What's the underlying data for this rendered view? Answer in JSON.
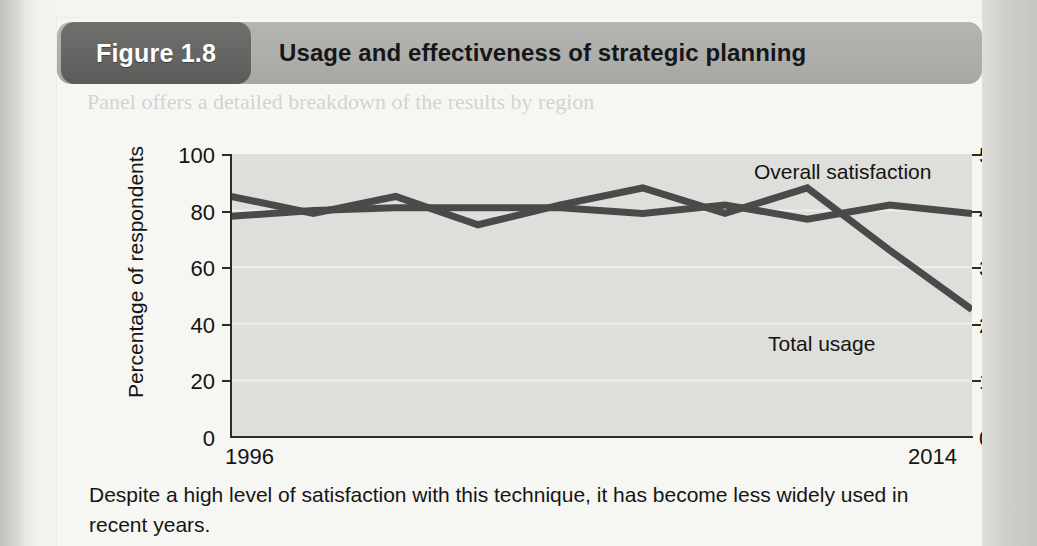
{
  "figure": {
    "badge_label": "Figure 1.8",
    "title": "Usage and effectiveness of strategic planning",
    "caption": "Despite a high level of satisfaction with this technique, it has become less widely used in recent years.",
    "ghost_text": "Panel offers a detailed breakdown of the results by region"
  },
  "colors": {
    "badge_background": "#646462",
    "header_background": "#aeaeaa",
    "plot_background": "#dededa",
    "line": "#4a4a4a",
    "axis": "#2b2b2b",
    "gridline": "#f0f0ec",
    "page_background": "#f6f6f3"
  },
  "chart_data": {
    "type": "line",
    "title": "Usage and effectiveness of strategic planning",
    "xlabel": "",
    "ylabel": "Percentage of respondents",
    "y2label": "5 = Highest satisfaction",
    "xlim": [
      1996,
      2014
    ],
    "ylim": [
      0,
      100
    ],
    "y2lim": [
      0,
      5
    ],
    "xticks": [
      1996,
      2014
    ],
    "xticklabels": [
      "1996",
      "2014"
    ],
    "yticks": [
      0,
      20,
      40,
      60,
      80,
      100
    ],
    "yticklabels": [
      "0",
      "20",
      "40",
      "60",
      "80",
      "100"
    ],
    "y2ticks": [
      0,
      1,
      2,
      3,
      4,
      5
    ],
    "y2ticklabels": [
      "0",
      "1",
      "2",
      "3",
      "4",
      "5"
    ],
    "grid": true,
    "legend_position": "inline-annotation",
    "x": [
      1996,
      1998,
      2000,
      2002,
      2004,
      2006,
      2008,
      2010,
      2012,
      2014
    ],
    "series": [
      {
        "name": "Total usage",
        "axis": "left",
        "units": "percentage of respondents",
        "values": [
          85,
          79,
          85,
          75,
          82,
          88,
          79,
          88,
          66,
          45
        ],
        "label_text": "Total usage"
      },
      {
        "name": "Overall satisfaction",
        "axis": "right",
        "units": "satisfaction score (5 = highest)",
        "values": [
          3.9,
          4.0,
          4.05,
          4.05,
          4.05,
          3.95,
          4.1,
          3.85,
          4.1,
          3.95
        ],
        "label_text": "Overall satisfaction"
      }
    ],
    "annotations": [
      {
        "text": "Overall satisfaction",
        "series": "Overall satisfaction"
      },
      {
        "text": "Total usage",
        "series": "Total usage"
      }
    ]
  }
}
